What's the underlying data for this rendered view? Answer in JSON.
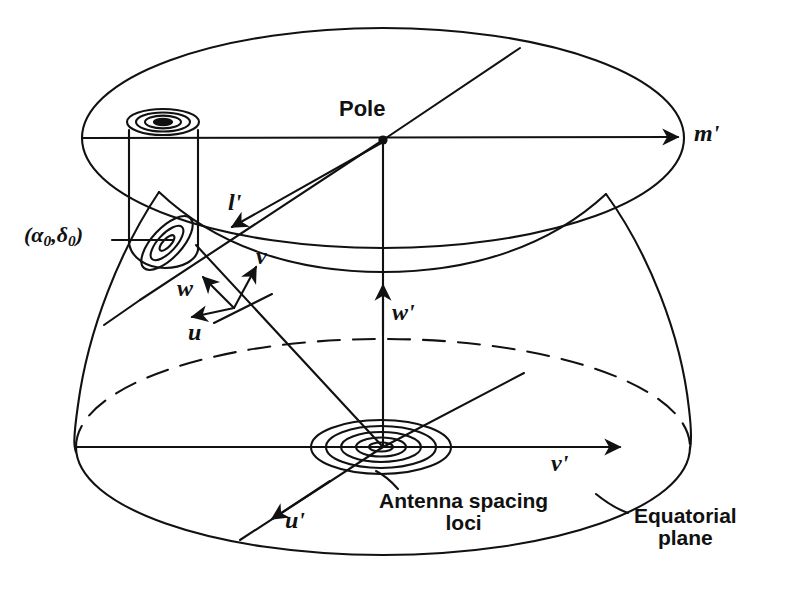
{
  "figure": {
    "background_color": "#ffffff",
    "ink_color": "#111111"
  },
  "labels": {
    "pole": "Pole",
    "m_prime": "m'",
    "l_prime": "l'",
    "source_coords_open": "(",
    "source_coords_alpha": "α",
    "source_coords_alpha_sub": "0",
    "source_coords_comma": ",",
    "source_coords_delta": "δ",
    "source_coords_delta_sub": "0",
    "source_coords_close": ")",
    "source_coords_full": "(α0,δ0)",
    "u": "u",
    "v": "v",
    "w": "w",
    "u_prime": "u'",
    "v_prime": "v'",
    "w_prime": "w'",
    "antenna_loci_line1": "Antenna spacing",
    "antenna_loci_line2": "loci",
    "equatorial_line1": "Equatorial",
    "equatorial_line2": "plane"
  },
  "geometry": {
    "pole_point": {
      "x": 383,
      "y": 140
    },
    "origin_point": {
      "x": 383,
      "y": 447
    },
    "uvw_origin": {
      "x": 234,
      "y": 308
    },
    "top_ellipse": {
      "cx": 383,
      "cy": 138,
      "rx": 301,
      "ry": 110
    },
    "equatorial_ellipse": {
      "cx": 383,
      "cy": 447,
      "rx": 307,
      "ry": 108
    },
    "sphere_left_edge_x": 76,
    "sphere_right_edge_x": 690,
    "cylinder": {
      "left_x": 128,
      "right_x": 198,
      "top_y": 118,
      "bottom_y": 258
    },
    "spacing_loci_rings": 5,
    "projected_loci_rings": 3
  }
}
